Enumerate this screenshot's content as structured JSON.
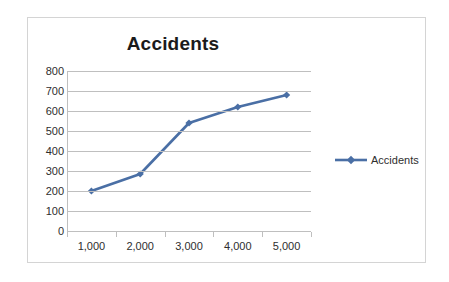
{
  "chart_data": {
    "type": "line",
    "title": "Accidents",
    "xlabel": "",
    "ylabel": "",
    "categories": [
      "1,000",
      "2,000",
      "3,000",
      "4,000",
      "5,000"
    ],
    "x": [
      1000,
      2000,
      3000,
      4000,
      5000
    ],
    "series": [
      {
        "name": "Accidents",
        "values": [
          200,
          285,
          540,
          620,
          680
        ],
        "color": "#4a6fa5",
        "marker": "diamond"
      }
    ],
    "ylim": [
      0,
      800
    ],
    "y_ticks": [
      "0",
      "100",
      "200",
      "300",
      "400",
      "500",
      "600",
      "700",
      "800"
    ],
    "y_tick_values": [
      0,
      100,
      200,
      300,
      400,
      500,
      600,
      700,
      800
    ],
    "grid": "horizontal",
    "legend_position": "right",
    "legend": [
      "Accidents"
    ],
    "plot_background": "#ffffff",
    "gridline_color": "#bfbfbf",
    "border_color": "#d4d4d4",
    "text_color": "#2e2e2e",
    "title_color": "#1b1b1b"
  }
}
